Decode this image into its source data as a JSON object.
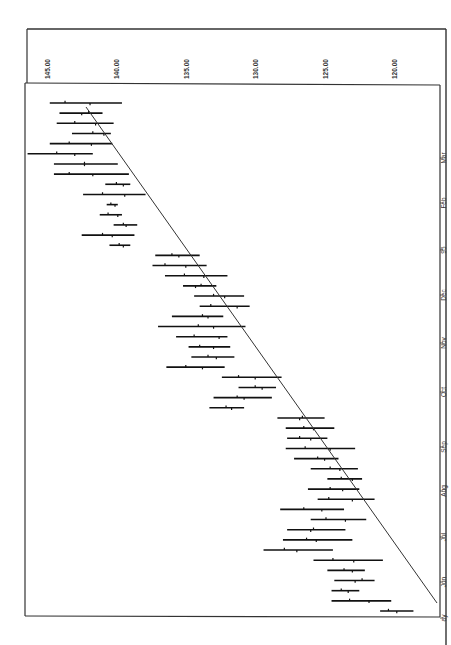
{
  "chart_data": {
    "type": "ohlc",
    "orientation": "rotated-90-clockwise",
    "title": "",
    "xlabel": "",
    "ylabel": "",
    "ylim": [
      118.5,
      146.5
    ],
    "y_axis_inverted_visual": true,
    "grid": false,
    "legend": null,
    "yticks": [
      "145.00",
      "140.00",
      "135.00",
      "130.00",
      "125.00",
      "120.00"
    ],
    "ytick_values": [
      145,
      140,
      135,
      130,
      125,
      120
    ],
    "xticks": [
      "ay",
      "Jun",
      "Jul",
      "Aug",
      "Sep",
      "Oct",
      "Nov",
      "Dec",
      "95",
      "Feb",
      "Mar"
    ],
    "trendline": {
      "from": {
        "index": 0,
        "value": 119.6
      },
      "to": {
        "index": 45,
        "value": 141.4
      }
    },
    "bars": [
      {
        "h": 121.0,
        "l": 118.6,
        "o": 120.4,
        "c": 119.8
      },
      {
        "h": 124.5,
        "l": 120.2,
        "o": 123.2,
        "c": 121.8
      },
      {
        "h": 124.5,
        "l": 122.5,
        "o": 123.8,
        "c": 123.3
      },
      {
        "h": 124.3,
        "l": 121.4,
        "o": 122.3,
        "c": 122.8
      },
      {
        "h": 124.8,
        "l": 122.1,
        "o": 123.6,
        "c": 123.0
      },
      {
        "h": 125.8,
        "l": 120.8,
        "o": 124.4,
        "c": 122.9
      },
      {
        "h": 129.4,
        "l": 124.4,
        "o": 127.9,
        "c": 127.0
      },
      {
        "h": 128.0,
        "l": 123.0,
        "o": 126.3,
        "c": 125.6
      },
      {
        "h": 127.7,
        "l": 123.5,
        "o": 125.8,
        "c": 126.0
      },
      {
        "h": 126.0,
        "l": 122.0,
        "o": 124.9,
        "c": 123.5
      },
      {
        "h": 128.2,
        "l": 123.6,
        "o": 126.5,
        "c": 125.2
      },
      {
        "h": 125.5,
        "l": 121.4,
        "o": 124.7,
        "c": 123.0
      },
      {
        "h": 126.2,
        "l": 122.5,
        "o": 124.6,
        "c": 123.7
      },
      {
        "h": 124.8,
        "l": 122.3,
        "o": 123.8,
        "c": 123.0
      },
      {
        "h": 126.0,
        "l": 122.6,
        "o": 124.6,
        "c": 123.9
      },
      {
        "h": 127.2,
        "l": 124.0,
        "o": 125.5,
        "c": 125.0
      },
      {
        "h": 127.8,
        "l": 122.8,
        "o": 126.4,
        "c": 124.6
      },
      {
        "h": 127.7,
        "l": 124.8,
        "o": 126.8,
        "c": 126.0
      },
      {
        "h": 127.8,
        "l": 124.3,
        "o": 126.5,
        "c": 125.8
      },
      {
        "h": 128.4,
        "l": 125.0,
        "o": 126.6,
        "c": 126.8
      },
      {
        "h": 133.3,
        "l": 130.8,
        "o": 132.1,
        "c": 131.7
      },
      {
        "h": 133.0,
        "l": 128.8,
        "o": 131.3,
        "c": 130.8
      },
      {
        "h": 131.2,
        "l": 128.5,
        "o": 130.0,
        "c": 129.5
      },
      {
        "h": 132.4,
        "l": 128.1,
        "o": 131.2,
        "c": 130.0
      },
      {
        "h": 136.4,
        "l": 132.2,
        "o": 135.0,
        "c": 133.8
      },
      {
        "h": 134.6,
        "l": 131.5,
        "o": 133.4,
        "c": 132.8
      },
      {
        "h": 134.8,
        "l": 131.8,
        "o": 134.0,
        "c": 133.0
      },
      {
        "h": 135.7,
        "l": 132.0,
        "o": 134.4,
        "c": 132.6
      },
      {
        "h": 137.0,
        "l": 130.7,
        "o": 134.1,
        "c": 133.0
      },
      {
        "h": 136.0,
        "l": 132.3,
        "o": 133.8,
        "c": 133.4
      },
      {
        "h": 134.0,
        "l": 130.4,
        "o": 133.2,
        "c": 131.3
      },
      {
        "h": 134.4,
        "l": 130.8,
        "o": 133.0,
        "c": 132.2
      },
      {
        "h": 135.2,
        "l": 132.8,
        "o": 133.9,
        "c": 134.3
      },
      {
        "h": 136.5,
        "l": 132.0,
        "o": 135.1,
        "c": 133.7
      },
      {
        "h": 137.4,
        "l": 133.5,
        "o": 136.5,
        "c": 135.0
      },
      {
        "h": 137.2,
        "l": 134.0,
        "o": 136.0,
        "c": 135.5
      },
      {
        "h": 140.5,
        "l": 139.0,
        "o": 139.8,
        "c": 139.5
      },
      {
        "h": 142.5,
        "l": 138.7,
        "o": 141.0,
        "c": 140.3
      },
      {
        "h": 140.2,
        "l": 138.5,
        "o": 139.5,
        "c": 139.3
      },
      {
        "h": 141.2,
        "l": 139.6,
        "o": 140.6,
        "c": 139.9
      },
      {
        "h": 140.7,
        "l": 139.9,
        "o": 140.4,
        "c": 140.1
      },
      {
        "h": 142.4,
        "l": 137.9,
        "o": 141.0,
        "c": 139.4
      },
      {
        "h": 140.8,
        "l": 139.0,
        "o": 140.0,
        "c": 139.5
      },
      {
        "h": 144.5,
        "l": 139.1,
        "o": 143.4,
        "c": 141.7
      },
      {
        "h": 144.5,
        "l": 139.9,
        "o": 142.3,
        "c": 142.3
      },
      {
        "h": 146.4,
        "l": 141.7,
        "o": 144.3,
        "c": 143.0
      },
      {
        "h": 144.8,
        "l": 140.3,
        "o": 143.4,
        "c": 141.8
      },
      {
        "h": 143.2,
        "l": 140.4,
        "o": 141.7,
        "c": 140.9
      },
      {
        "h": 144.3,
        "l": 140.2,
        "o": 143.0,
        "c": 141.5
      },
      {
        "h": 144.1,
        "l": 141.0,
        "o": 142.0,
        "c": 142.5
      },
      {
        "h": 144.8,
        "l": 139.6,
        "o": 143.7,
        "c": 141.9
      }
    ]
  }
}
